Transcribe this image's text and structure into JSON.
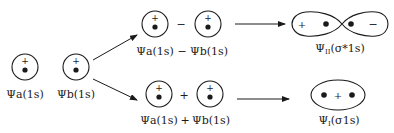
{
  "diagram": {
    "type": "molecular-orbital-formation",
    "atomic_orbitals": [
      {
        "label": "Ψa(1s)",
        "sign": "+"
      },
      {
        "label": "Ψb(1s)",
        "sign": "+"
      }
    ],
    "subtraction_combination": {
      "operator": "−",
      "label_left": "Ψa(1s)",
      "label_op": "−",
      "label_right": "Ψb(1s)",
      "orbital_signs": [
        "+",
        "+"
      ]
    },
    "addition_combination": {
      "operator": "+",
      "label_left": "Ψa(1s)",
      "label_op": "+",
      "label_right": "Ψb(1s)",
      "orbital_signs": [
        "+",
        "+"
      ]
    },
    "antibonding": {
      "label": "ΨII(σ*1s)",
      "psi": "Ψ",
      "subscript": "II",
      "suffix": "(σ*1s)",
      "lobe_signs": [
        "+",
        "−"
      ]
    },
    "bonding": {
      "label": "ΨI(σ1s)",
      "psi": "Ψ",
      "subscript": "I",
      "suffix": "(σ1s)",
      "sign": "+"
    },
    "colors": {
      "stroke": "#1a1a1a",
      "background": "#ffffff"
    }
  }
}
